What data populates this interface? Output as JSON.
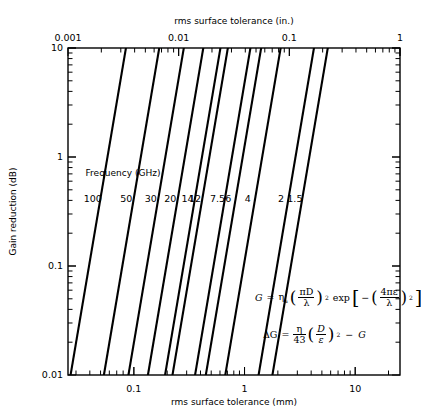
{
  "chart_data": {
    "type": "line",
    "title": "",
    "xlabel": "rms surface tolerance (mm)",
    "xlabel_top": "rms surface tolerance (in.)",
    "ylabel": "Gain reduction (dB)",
    "xscale": "log",
    "yscale": "log",
    "grid": false,
    "legend_position": "inside-plot-center-left",
    "legend_title": "Frequency (GHz)",
    "xlim_mm": [
      0.022,
      25.4
    ],
    "xlim_in": [
      0.001,
      1
    ],
    "ylim": [
      0.01,
      10
    ],
    "xticks_mm": [
      0.1,
      1,
      10
    ],
    "xtick_labels_mm": [
      "0.1",
      "1",
      "10"
    ],
    "xticks_in": [
      0.001,
      0.01,
      0.1,
      1
    ],
    "xtick_labels_in": [
      "0.001",
      "0.01",
      "0.1",
      "1"
    ],
    "yticks": [
      0.01,
      0.1,
      1,
      10
    ],
    "ytick_labels": [
      "0.01",
      "0.1",
      "1",
      "10"
    ],
    "slope_log_log": 2,
    "series": [
      {
        "name": "100",
        "frequency_ghz": 100,
        "label": "100",
        "label_x_mm": 0.0425,
        "x_at_y0p01_mm": 0.0268,
        "x_at_y10_mm": 0.0848
      },
      {
        "name": "50",
        "frequency_ghz": 50,
        "label": "50",
        "label_x_mm": 0.0855,
        "x_at_y0p01_mm": 0.0536,
        "x_at_y10_mm": 0.1696
      },
      {
        "name": "30",
        "frequency_ghz": 30,
        "label": "30",
        "label_x_mm": 0.1425,
        "x_at_y0p01_mm": 0.0893,
        "x_at_y10_mm": 0.2827
      },
      {
        "name": "20",
        "frequency_ghz": 20,
        "label": "20",
        "label_x_mm": 0.2138,
        "x_at_y0p01_mm": 0.134,
        "x_at_y10_mm": 0.424
      },
      {
        "name": "14",
        "frequency_ghz": 14,
        "label": "14",
        "label_x_mm": 0.3054,
        "x_at_y0p01_mm": 0.1914,
        "x_at_y10_mm": 0.6057
      },
      {
        "name": "12",
        "frequency_ghz": 12,
        "label": "12",
        "label_x_mm": 0.3563,
        "x_at_y0p01_mm": 0.2233,
        "x_at_y10_mm": 0.7067
      },
      {
        "name": "7.5",
        "frequency_ghz": 7.5,
        "label": "7.5",
        "label_x_mm": 0.57,
        "x_at_y0p01_mm": 0.3573,
        "x_at_y10_mm": 1.1307
      },
      {
        "name": "6",
        "frequency_ghz": 6,
        "label": "6",
        "label_x_mm": 0.7125,
        "x_at_y0p01_mm": 0.4467,
        "x_at_y10_mm": 1.4134
      },
      {
        "name": "4",
        "frequency_ghz": 4,
        "label": "4",
        "label_x_mm": 1.0688,
        "x_at_y0p01_mm": 0.67,
        "x_at_y10_mm": 2.1201
      },
      {
        "name": "2",
        "frequency_ghz": 2,
        "label": "2",
        "label_x_mm": 2.1375,
        "x_at_y0p01_mm": 1.34,
        "x_at_y10_mm": 4.2402
      },
      {
        "name": "1.5",
        "frequency_ghz": 1.5,
        "label": "1.5",
        "label_x_mm": 2.85,
        "x_at_y0p01_mm": 1.7867,
        "x_at_y10_mm": 5.6536
      }
    ],
    "annotations": {
      "equation_1": {
        "lhs": "G",
        "eq": "=",
        "eta": "η",
        "eta_sub": "a",
        "frac1_num": "πD",
        "frac1_den": "λ",
        "exp1": "2",
        "exp_fn": "exp",
        "minus": "−",
        "frac2_num": "4πε",
        "frac2_den": "λ",
        "exp2": "2",
        "plain": "G = ηa(πD/λ)² exp[−(4πε/λ)²]"
      },
      "equation_2": {
        "lhs": "ΔG",
        "eq": "=",
        "frac1_num": "η",
        "frac1_den": "43",
        "frac2_num": "D",
        "frac2_den": "ε",
        "exp1": "2",
        "minus": "−",
        "rhs": "G",
        "plain": "ΔG = (η/43)(D/ε)² − G"
      }
    }
  }
}
